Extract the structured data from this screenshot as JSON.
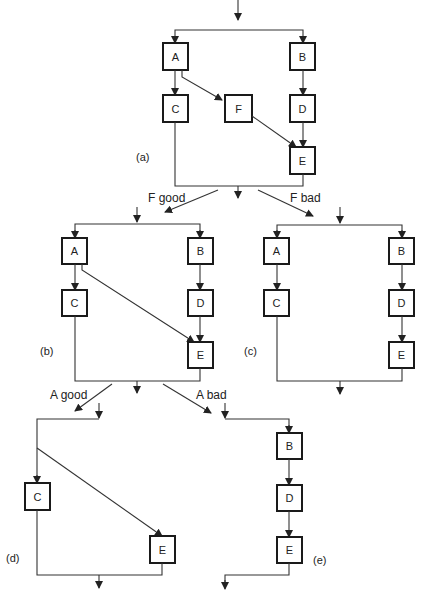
{
  "diagrams": {
    "a": {
      "caption": "(a)",
      "boxes": {
        "A": "A",
        "B": "B",
        "C": "C",
        "D": "D",
        "E": "E",
        "F": "F"
      }
    },
    "b": {
      "caption": "(b)",
      "boxes": {
        "A": "A",
        "B": "B",
        "C": "C",
        "D": "D",
        "E": "E"
      }
    },
    "c": {
      "caption": "(c)",
      "boxes": {
        "A": "A",
        "B": "B",
        "C": "C",
        "D": "D",
        "E": "E"
      }
    },
    "d": {
      "caption": "(d)",
      "boxes": {
        "C": "C",
        "E": "E"
      }
    },
    "e": {
      "caption": "(e)",
      "boxes": {
        "B": "B",
        "D": "D",
        "E": "E"
      }
    }
  },
  "branches": {
    "f_good": "F good",
    "f_bad": "F bad",
    "a_good": "A good",
    "a_bad": "A bad"
  },
  "colors": {
    "line": "#333333",
    "box_border": "#1a1a1a",
    "background": "#ffffff"
  }
}
